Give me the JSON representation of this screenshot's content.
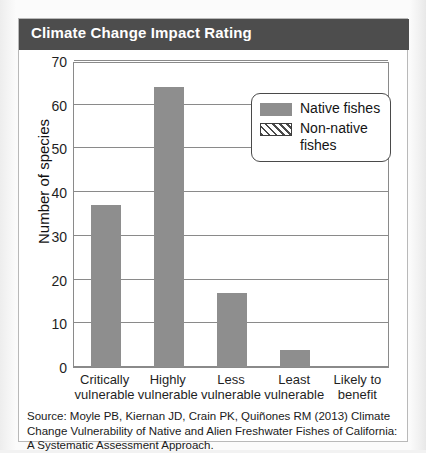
{
  "card": {
    "title": "Climate Change Impact Rating",
    "source": "Source: Moyle PB, Kiernan JD, Crain PK, Quiñones RM (2013) Climate Change Vulnerability of Native and Alien Freshwater Fishes of California: A Systematic Assessment Approach."
  },
  "colors": {
    "title_bar": "#4d4d4d",
    "bar_fill": "#8e8e8e",
    "axis": "#8a8a8a",
    "card_bg": "#ffffff",
    "page_bg": "#f2f2f2"
  },
  "chart_data": {
    "type": "bar",
    "title": "Climate Change Impact Rating",
    "xlabel": "",
    "ylabel": "Number of species",
    "categories": [
      "Critically vulnerable",
      "Highly vulnerable",
      "Less vulnerable",
      "Least vulnerable",
      "Likely to benefit"
    ],
    "category_lines": [
      [
        "Critically",
        "vulnerable"
      ],
      [
        "Highly",
        "vulnerable"
      ],
      [
        "Less",
        "vulnerable"
      ],
      [
        "Least",
        "vulnerable"
      ],
      [
        "Likely to",
        "benefit"
      ]
    ],
    "series": [
      {
        "name": "Native fishes",
        "values": [
          37,
          64,
          17,
          4,
          0
        ]
      },
      {
        "name": "Non-native fishes",
        "values": [
          0,
          0,
          0,
          0,
          0
        ]
      }
    ],
    "ylim": [
      0,
      70
    ],
    "yticks": [
      0,
      10,
      20,
      30,
      40,
      50,
      60,
      70
    ],
    "ytick_labels": [
      "0",
      "10",
      "20",
      "30",
      "40",
      "50",
      "60",
      "70"
    ],
    "grid": true,
    "legend_position": "top-right",
    "legend": [
      {
        "label": "Native fishes",
        "lines": [
          "Native fishes"
        ],
        "swatch": "solid"
      },
      {
        "label": "Non-native fishes",
        "lines": [
          "Non-native",
          "fishes"
        ],
        "swatch": "hatch"
      }
    ]
  }
}
